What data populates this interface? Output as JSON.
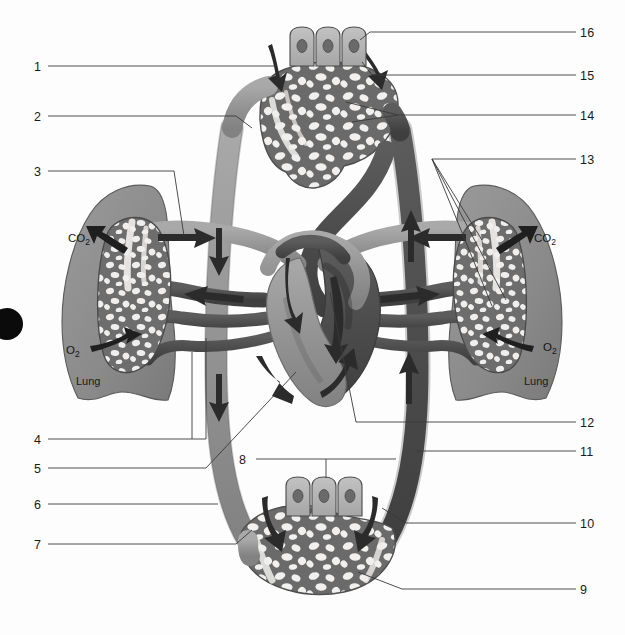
{
  "figure": {
    "background_color": "#fdfdfd",
    "ink_color": "#1a1a1a"
  },
  "palette": {
    "oxygenated_vessel": "#9a9a9a",
    "deoxygenated_vessel": "#4f4f4f",
    "vessel_outline": "#6d6d6d",
    "lung_fill": "#8d8d8d",
    "lung_outline": "#5a5a5a",
    "capillary_mesh_dark": "#6e6e6e",
    "capillary_void": "#f2f2f2",
    "cell_fill": "#b6b6b6",
    "cell_outline": "#4a4a4a",
    "nucleus": "#6a6a6a",
    "arrow_dark": "#2b2b2b",
    "leader_line": "#3a3a3a",
    "corner_dot": "#0b0b0b"
  },
  "labels_left": [
    {
      "id": "1",
      "text": "1",
      "x": 34,
      "y": 61
    },
    {
      "id": "2",
      "text": "2",
      "x": 34,
      "y": 111
    },
    {
      "id": "3",
      "text": "3",
      "x": 34,
      "y": 166
    },
    {
      "id": "4",
      "text": "4",
      "x": 34,
      "y": 434
    },
    {
      "id": "5",
      "text": "5",
      "x": 34,
      "y": 463
    },
    {
      "id": "6",
      "text": "6",
      "x": 34,
      "y": 499
    },
    {
      "id": "7",
      "text": "7",
      "x": 34,
      "y": 539
    }
  ],
  "labels_center": [
    {
      "id": "8",
      "text": "8",
      "x": 239,
      "y": 454
    }
  ],
  "labels_right": [
    {
      "id": "16",
      "text": "16",
      "x": 580,
      "y": 27
    },
    {
      "id": "15",
      "text": "15",
      "x": 580,
      "y": 70
    },
    {
      "id": "14",
      "text": "14",
      "x": 580,
      "y": 110
    },
    {
      "id": "13",
      "text": "13",
      "x": 580,
      "y": 154
    },
    {
      "id": "12",
      "text": "12",
      "x": 580,
      "y": 417
    },
    {
      "id": "11",
      "text": "11",
      "x": 580,
      "y": 446
    },
    {
      "id": "10",
      "text": "10",
      "x": 580,
      "y": 518
    },
    {
      "id": "9",
      "text": "9",
      "x": 580,
      "y": 584
    }
  ],
  "gas_labels": [
    {
      "id": "co2-left",
      "text": "CO",
      "sub": "2",
      "x": 68,
      "y": 232
    },
    {
      "id": "o2-left",
      "text": "O",
      "sub": "2",
      "x": 66,
      "y": 344
    },
    {
      "id": "co2-right",
      "text": "CO",
      "sub": "2",
      "x": 534,
      "y": 232
    },
    {
      "id": "o2-right",
      "text": "O",
      "sub": "2",
      "x": 543,
      "y": 341
    }
  ],
  "organ_labels": [
    {
      "id": "lung-left",
      "text": "Lung",
      "x": 76,
      "y": 375
    },
    {
      "id": "lung-right",
      "text": "Lung",
      "x": 524,
      "y": 375
    }
  ],
  "cells": {
    "top_count": 3,
    "bottom_count": 3
  }
}
